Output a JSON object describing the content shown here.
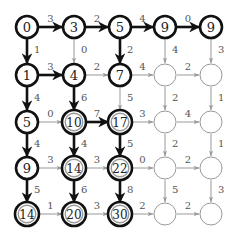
{
  "diagram": {
    "type": "grid-dag",
    "rows": 5,
    "cols": 5,
    "layout": {
      "col_x": [
        27,
        74,
        120,
        165,
        211
      ],
      "row_y": [
        27,
        75,
        122,
        168,
        214
      ],
      "radius": 11
    },
    "colors": {
      "bold": "#111111",
      "light": "#999999",
      "inner_ring": "#9a9a9a",
      "node_fill": "#ffffff"
    },
    "nodes": [
      [
        {
          "label": "0",
          "style": "bold"
        },
        {
          "label": "3",
          "style": "bold"
        },
        {
          "label": "5",
          "style": "bold"
        },
        {
          "label": "9",
          "style": "bold"
        },
        {
          "label": "9",
          "style": "bold"
        }
      ],
      [
        {
          "label": "1",
          "style": "bold"
        },
        {
          "label": "4",
          "style": "bold"
        },
        {
          "label": "7",
          "style": "bold"
        },
        {
          "label": "",
          "style": "empty"
        },
        {
          "label": "",
          "style": "empty"
        }
      ],
      [
        {
          "label": "5",
          "style": "bold"
        },
        {
          "label": "10",
          "style": "double"
        },
        {
          "label": "17",
          "style": "double"
        },
        {
          "label": "",
          "style": "empty"
        },
        {
          "label": "",
          "style": "empty"
        }
      ],
      [
        {
          "label": "9",
          "style": "bold"
        },
        {
          "label": "14",
          "style": "double"
        },
        {
          "label": "22",
          "style": "double"
        },
        {
          "label": "",
          "style": "empty"
        },
        {
          "label": "",
          "style": "empty"
        }
      ],
      [
        {
          "label": "14",
          "style": "double"
        },
        {
          "label": "20",
          "style": "double"
        },
        {
          "label": "30",
          "style": "double"
        },
        {
          "label": "",
          "style": "empty"
        },
        {
          "label": "",
          "style": "empty"
        }
      ]
    ],
    "horizontal_edges": [
      [
        {
          "weight": "3",
          "bold": true
        },
        {
          "weight": "2",
          "bold": true
        },
        {
          "weight": "4",
          "bold": true
        },
        {
          "weight": "0",
          "bold": true
        }
      ],
      [
        {
          "weight": "3",
          "bold": true
        },
        {
          "weight": "2",
          "bold": false
        },
        {
          "weight": "4",
          "bold": false
        },
        {
          "weight": "2",
          "bold": false
        }
      ],
      [
        {
          "weight": "0",
          "bold": false
        },
        {
          "weight": "7",
          "bold": true
        },
        {
          "weight": "3",
          "bold": false
        },
        {
          "weight": "4",
          "bold": false
        }
      ],
      [
        {
          "weight": "3",
          "bold": false
        },
        {
          "weight": "3",
          "bold": false
        },
        {
          "weight": "0",
          "bold": false
        },
        {
          "weight": "2",
          "bold": false
        }
      ],
      [
        {
          "weight": "1",
          "bold": false
        },
        {
          "weight": "3",
          "bold": false
        },
        {
          "weight": "2",
          "bold": false
        },
        {
          "weight": "2",
          "bold": false
        }
      ]
    ],
    "vertical_edges": [
      [
        {
          "weight": "1",
          "bold": true
        },
        {
          "weight": "0",
          "bold": false
        },
        {
          "weight": "2",
          "bold": true
        },
        {
          "weight": "4",
          "bold": false
        },
        {
          "weight": "3",
          "bold": false
        }
      ],
      [
        {
          "weight": "4",
          "bold": true
        },
        {
          "weight": "6",
          "bold": true
        },
        {
          "weight": "5",
          "bold": false
        },
        {
          "weight": "2",
          "bold": false
        },
        {
          "weight": "1",
          "bold": false
        }
      ],
      [
        {
          "weight": "4",
          "bold": true
        },
        {
          "weight": "4",
          "bold": true
        },
        {
          "weight": "5",
          "bold": true
        },
        {
          "weight": "2",
          "bold": false
        },
        {
          "weight": "1",
          "bold": false
        }
      ],
      [
        {
          "weight": "5",
          "bold": true
        },
        {
          "weight": "6",
          "bold": true
        },
        {
          "weight": "8",
          "bold": true
        },
        {
          "weight": "5",
          "bold": false
        },
        {
          "weight": "3",
          "bold": false
        }
      ]
    ]
  }
}
